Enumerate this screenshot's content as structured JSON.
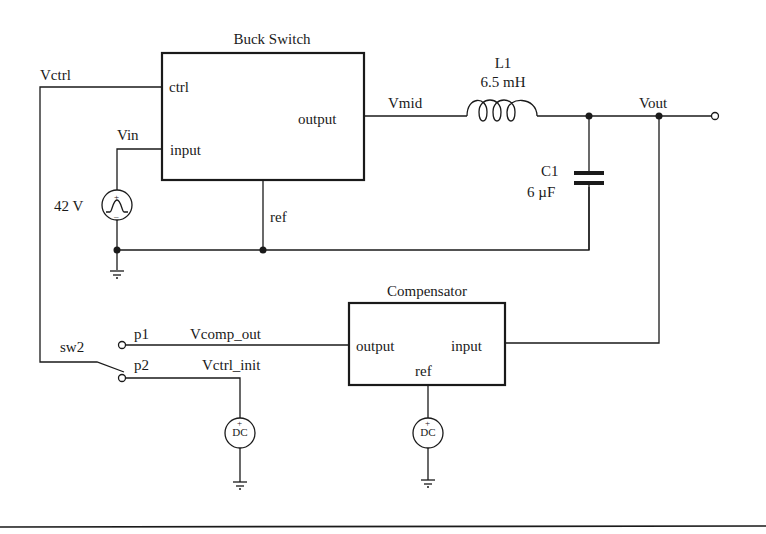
{
  "blocks": {
    "buck_switch": {
      "title": "Buck Switch",
      "ports": {
        "ctrl": "ctrl",
        "input": "input",
        "output": "output",
        "ref": "ref"
      }
    },
    "compensator": {
      "title": "Compensator",
      "ports": {
        "output": "output",
        "input": "input",
        "ref": "ref"
      }
    }
  },
  "components": {
    "inductor": {
      "name": "L1",
      "value": "6.5 mH"
    },
    "capacitor": {
      "name": "C1",
      "value": "6 µF"
    },
    "vin_source": {
      "value": "42 V",
      "type": "trapezoidal-source"
    },
    "dc_source_1": {
      "label": "DC"
    },
    "dc_source_2": {
      "label": "DC"
    },
    "switch": {
      "name": "sw2",
      "pole1": "p1",
      "pole2": "p2"
    }
  },
  "nets": {
    "vctrl": "Vctrl",
    "vin": "Vin",
    "vmid": "Vmid",
    "vout": "Vout",
    "vcomp_out": "Vcomp_out",
    "vctrl_init": "Vctrl_init"
  },
  "colors": {
    "ink": "#1a1a1a",
    "background": "#ffffff"
  }
}
